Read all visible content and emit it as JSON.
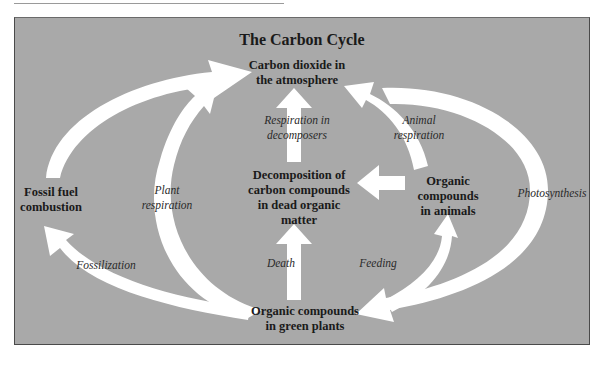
{
  "title": "The Carbon Cycle",
  "colors": {
    "panel": "#a9a9a9",
    "arrow": "#ffffff",
    "text": "#1a1a1a"
  },
  "nodes": {
    "atmosphere": {
      "line1": "Carbon dioxide in",
      "line2": "the atmosphere"
    },
    "fossil": {
      "line1": "Fossil fuel",
      "line2": "combustion"
    },
    "decomposition": {
      "line1": "Decomposition of",
      "line2": "carbon compounds",
      "line3": "in dead organic",
      "line4": "matter"
    },
    "animals": {
      "line1": "Organic",
      "line2": "compounds",
      "line3": "in animals"
    },
    "plants": {
      "line1": "Organic compounds",
      "line2": "in green plants"
    }
  },
  "processes": {
    "respiration_decomposers": {
      "line1": "Respiration in",
      "line2": "decomposers"
    },
    "animal_respiration": {
      "line1": "Animal",
      "line2": "respiration"
    },
    "plant_respiration": {
      "line1": "Plant",
      "line2": "respiration"
    },
    "photosynthesis": {
      "line1": "Photosynthesis"
    },
    "fossilization": {
      "line1": "Fossilization"
    },
    "death": {
      "line1": "Death"
    },
    "feeding": {
      "line1": "Feeding"
    }
  }
}
